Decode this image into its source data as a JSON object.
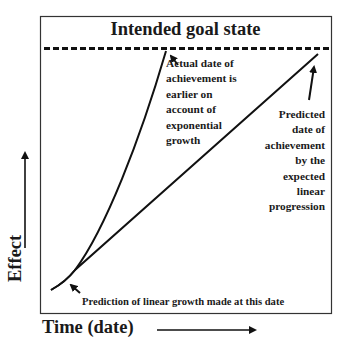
{
  "diagram": {
    "goal_label": "Intended goal state",
    "actual_label_lines": [
      "Actual date of",
      "achievement is",
      "earlier on",
      "account of",
      "exponential",
      "growth"
    ],
    "predicted_label_lines": [
      "Predicted",
      "date of",
      "achievement",
      "by the",
      "expected",
      "linear",
      "progression"
    ],
    "prediction_note": "Prediction of linear growth made at this date",
    "x_axis_label": "Time (date)",
    "y_axis_label": "Effect",
    "series": [
      {
        "name": "exponential-growth-curve",
        "type": "curve"
      },
      {
        "name": "linear-progression-line",
        "type": "line"
      }
    ],
    "colors": {
      "stroke": "#111111",
      "background": "#ffffff"
    }
  }
}
